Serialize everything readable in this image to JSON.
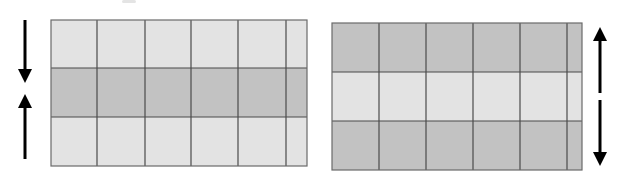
{
  "figure": {
    "colors": {
      "light_cell": "#e3e3e3",
      "dark_cell": "#c2c2c2",
      "grid_line": "#4a4a4a",
      "arrow": "#000000"
    },
    "panels": [
      {
        "id": "left",
        "x": 51,
        "y": 20,
        "width": 256,
        "height": 146,
        "col_lines": [
          97,
          145,
          191,
          238,
          286
        ],
        "row_lines": [
          68,
          117
        ],
        "row_shades": [
          "light",
          "dark",
          "light"
        ],
        "arrows": [
          {
            "direction": "down",
            "x": 25,
            "y1": 20,
            "y2": 82
          },
          {
            "direction": "up",
            "x": 25,
            "y1": 159,
            "y2": 95
          }
        ],
        "meaning": "converging arrows: middle band squeezed"
      },
      {
        "id": "right",
        "x": 332,
        "y": 23,
        "width": 250,
        "height": 147,
        "col_lines": [
          379,
          426,
          473,
          520,
          567
        ],
        "row_lines": [
          72,
          121
        ],
        "row_shades": [
          "dark",
          "light",
          "dark"
        ],
        "arrows": [
          {
            "direction": "up",
            "x": 600,
            "y1": 93,
            "y2": 27
          },
          {
            "direction": "down",
            "x": 600,
            "y1": 100,
            "y2": 166
          }
        ],
        "meaning": "diverging arrows: middle band stretched"
      }
    ]
  }
}
